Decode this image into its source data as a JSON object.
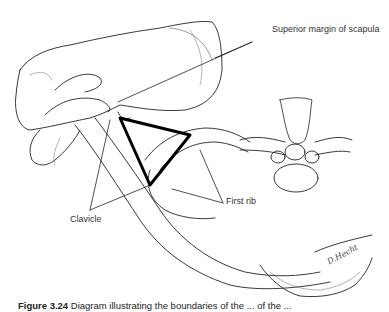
{
  "figure": {
    "type": "anatomical illustration",
    "labels": {
      "superior_margin": "Superior margin of scapula",
      "clavicle": "Clavicle",
      "first_rib": "First rib"
    },
    "signature": "D.Hecht",
    "caption_number": "Figure 3.24",
    "caption_text": "Diagram illustrating the boundaries of the ... of the ..."
  }
}
